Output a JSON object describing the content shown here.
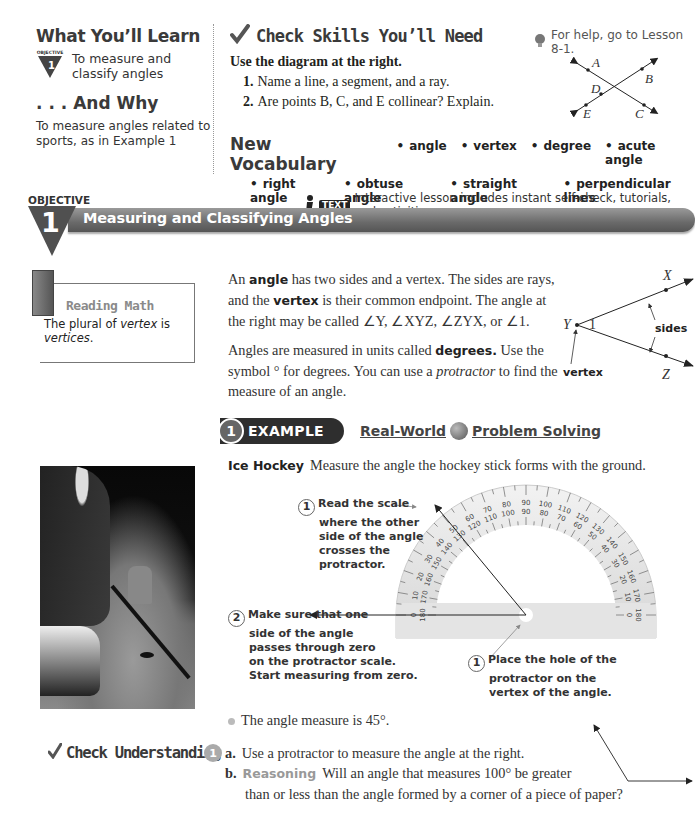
{
  "learn": {
    "title": "What You’ll Learn",
    "objective_badge_label": "OBJECTIVE",
    "objective_number": "1",
    "objective_text": "To measure and classify angles",
    "why_title": ". . . And Why",
    "why_text": "To measure angles related to sports, as in Example 1"
  },
  "skills": {
    "title": "Check Skills You’ll Need",
    "help_text": "For help, go to Lesson 8-1.",
    "intro": "Use the diagram at the right.",
    "questions": [
      {
        "num": "1.",
        "text": "Name a line, a segment, and a ray."
      },
      {
        "num": "2.",
        "text": "Are points B, C, and E collinear? Explain."
      }
    ],
    "diagram_labels": {
      "a": "A",
      "b": "B",
      "c": "C",
      "d": "D",
      "e": "E"
    }
  },
  "vocab": {
    "title": "New Vocabulary",
    "row1": [
      "angle",
      "vertex",
      "degree",
      "acute angle"
    ],
    "row2": [
      "right angle",
      "obtuse angle",
      "straight angle",
      "perpendicular lines"
    ]
  },
  "objective": {
    "label": "OBJECTIVE",
    "number": "1",
    "title": "Measuring and Classifying Angles",
    "itext_logo": "TEXT",
    "itext_text": "Interactive lesson includes instant self-check, tutorials, and activities."
  },
  "reading_math": {
    "title": "Reading Math",
    "body_prefix": "The plural of ",
    "body_italic1": "vertex",
    "body_mid": " is ",
    "body_italic2": "vertices",
    "body_suffix": "."
  },
  "definition": {
    "p1_a": "An ",
    "p1_kw1": "angle",
    "p1_b": " has two sides and a vertex. The sides are rays, and the ",
    "p1_kw2": "vertex",
    "p1_c": " is their common endpoint. The angle at the right may be called ∠Y, ∠XYZ, ∠ZYX, or ∠1.",
    "p2_a": "Angles are measured in units called ",
    "p2_kw": "degrees.",
    "p2_b": " Use the symbol ° for degrees. You can use a ",
    "p2_italic": "protractor",
    "p2_c": " to find the measure of an angle.",
    "diagram": {
      "x": "X",
      "y": "Y",
      "z": "Z",
      "one": "1",
      "sides": "sides",
      "vertex": "vertex"
    }
  },
  "example": {
    "number": "1",
    "label": "EXAMPLE",
    "banner_a": "Real-World",
    "banner_b": "Problem Solving",
    "topic": "Ice Hockey",
    "prompt": "Measure the angle the hockey stick forms with the ground.",
    "steps": [
      {
        "num": "3",
        "lines": [
          "Read the scale",
          "where the other",
          "side of the angle",
          "crosses the",
          "protractor."
        ]
      },
      {
        "num": "2",
        "lines": [
          "Make sure that one",
          "side of the angle",
          "passes through zero",
          "on the protractor scale.",
          "Start measuring from zero."
        ]
      },
      {
        "num": "1",
        "lines": [
          "Place the hole of the",
          "protractor on the",
          "vertex of the angle."
        ]
      }
    ],
    "outer_scale": [
      "0",
      "10",
      "20",
      "30",
      "40",
      "50",
      "60",
      "70",
      "80",
      "90",
      "100",
      "110",
      "120",
      "130",
      "140",
      "150",
      "160",
      "170",
      "180"
    ],
    "inner_scale": [
      "180",
      "170",
      "160",
      "150",
      "140",
      "130",
      "120",
      "110",
      "100",
      "90",
      "80",
      "70",
      "60",
      "50",
      "40",
      "30",
      "20",
      "10",
      "0"
    ],
    "answer": "The angle measure is 45°."
  },
  "check_understanding": {
    "title": "Check Understanding",
    "number": "1",
    "a_label": "a.",
    "a_text": "Use a protractor to measure the angle at the right.",
    "b_label": "b.",
    "b_reason": "Reasoning",
    "b_text": "Will an angle that measures 100° be greater",
    "b_cont": "than or less than the angle formed by a corner of a piece of paper?"
  }
}
